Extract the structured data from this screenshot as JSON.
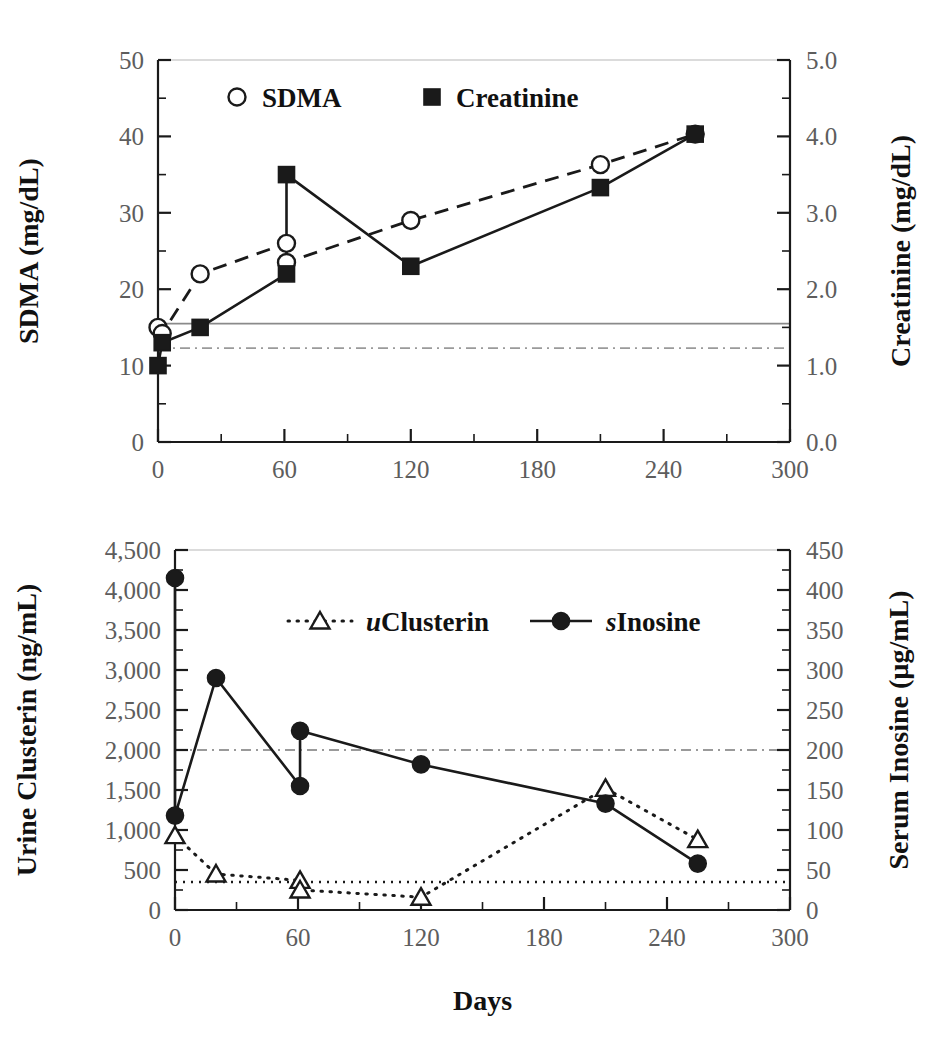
{
  "figure": {
    "xlabel": "Days",
    "xticks": [
      "0",
      "60",
      "120",
      "180",
      "240",
      "300"
    ]
  },
  "chart_data": [
    {
      "type": "line",
      "panel": "top",
      "title": "",
      "xlabel": "",
      "ylabel": "SDMA (mg/dL)",
      "y2label": "Creatinine (mg/dL)",
      "xlim": [
        0,
        300
      ],
      "ylim": [
        0,
        50
      ],
      "y2lim": [
        0.0,
        5.0
      ],
      "xticks": [
        0,
        60,
        120,
        180,
        240,
        300
      ],
      "xticklabels": [
        "0",
        "60",
        "120",
        "180",
        "240",
        "300"
      ],
      "yticks": [
        0,
        10,
        20,
        30,
        40,
        50
      ],
      "yticklabels": [
        "0",
        "10",
        "20",
        "30",
        "40",
        "50"
      ],
      "y2ticks": [
        0.0,
        1.0,
        2.0,
        3.0,
        4.0,
        5.0
      ],
      "y2ticklabels": [
        "0.0",
        "1.0",
        "2.0",
        "3.0",
        "4.0",
        "5.0"
      ],
      "minor_tick_interval_x": 30,
      "minor_tick_interval_y": 5,
      "minor_tick_interval_y2": 0.5,
      "grid": false,
      "legend_position": "top-center",
      "series": [
        {
          "name": "SDMA",
          "axis": "left",
          "marker": "open-circle",
          "linestyle": "dashed",
          "x": [
            0,
            2,
            20,
            61,
            61,
            120,
            210,
            255
          ],
          "values": [
            15.0,
            14.2,
            22.0,
            26.0,
            23.5,
            29.0,
            36.3,
            40.3
          ]
        },
        {
          "name": "Creatinine",
          "axis": "right",
          "marker": "filled-square",
          "linestyle": "solid",
          "x": [
            0,
            2,
            20,
            61,
            61,
            120,
            210,
            255
          ],
          "values": [
            1.0,
            1.3,
            1.5,
            2.2,
            3.5,
            2.3,
            3.33,
            4.03
          ],
          "values_in_left_units": [
            10.0,
            13.0,
            15.0,
            22.0,
            35.0,
            23.0,
            33.3,
            40.3
          ]
        }
      ],
      "reference_lines": [
        {
          "name": "sdma-upper-reference",
          "style": "solid",
          "y_left": 15.5,
          "y_right": 1.55
        },
        {
          "name": "creatinine-upper-reference",
          "style": "dash-dot",
          "y_left": 12.3,
          "y_right": 1.23
        }
      ],
      "legend": [
        {
          "label": "SDMA",
          "marker": "open-circle"
        },
        {
          "label": "Creatinine",
          "marker": "filled-square"
        }
      ]
    },
    {
      "type": "line",
      "panel": "bottom",
      "title": "",
      "xlabel": "Days",
      "ylabel": "Urine Clusterin (ng/mL)",
      "y2label": "Serum Inosine (µg/mL)",
      "xlim": [
        0,
        300
      ],
      "ylim": [
        0,
        4500
      ],
      "y2lim": [
        0,
        450
      ],
      "xticks": [
        0,
        60,
        120,
        180,
        240,
        300
      ],
      "xticklabels": [
        "0",
        "60",
        "120",
        "180",
        "240",
        "300"
      ],
      "yticks": [
        0,
        500,
        1000,
        1500,
        2000,
        2500,
        3000,
        3500,
        4000,
        4500
      ],
      "yticklabels": [
        "0",
        "500",
        "1,000",
        "1,500",
        "2,000",
        "2,500",
        "3,000",
        "3,500",
        "4,000",
        "4,500"
      ],
      "y2ticks": [
        0,
        50,
        100,
        150,
        200,
        250,
        300,
        350,
        400,
        450
      ],
      "y2ticklabels": [
        "0",
        "50",
        "100",
        "150",
        "200",
        "250",
        "300",
        "350",
        "400",
        "450"
      ],
      "minor_tick_interval_x": 30,
      "minor_tick_interval_y": 250,
      "minor_tick_interval_y2": 25,
      "grid": false,
      "legend_position": "top-center",
      "series": [
        {
          "name": "uClusterin",
          "label_italic_prefix": "u",
          "label_rest": "Clusterin",
          "axis": "left",
          "marker": "open-triangle",
          "linestyle": "dotted",
          "x": [
            0,
            20,
            61,
            61,
            120,
            210,
            255
          ],
          "values": [
            930,
            450,
            370,
            250,
            160,
            1520,
            880
          ]
        },
        {
          "name": "sInosine",
          "label_italic_prefix": "s",
          "label_rest": "Inosine",
          "axis": "right",
          "marker": "filled-circle",
          "linestyle": "solid",
          "x": [
            0,
            0,
            20,
            61,
            61,
            120,
            210,
            255
          ],
          "values": [
            415,
            118,
            290,
            155,
            224,
            182,
            133,
            58
          ],
          "values_in_left_units": [
            4150,
            1180,
            2900,
            1550,
            2240,
            1820,
            1330,
            580
          ]
        }
      ],
      "reference_lines": [
        {
          "name": "inosine-upper-reference",
          "style": "dash-dot",
          "y_left": 2000,
          "y_right": 200
        },
        {
          "name": "clusterin-upper-reference",
          "style": "dotted",
          "y_left": 350,
          "y_right": 35
        }
      ],
      "legend": [
        {
          "label": "uClusterin",
          "marker": "open-triangle"
        },
        {
          "label": "sInosine",
          "marker": "filled-circle"
        }
      ]
    }
  ]
}
